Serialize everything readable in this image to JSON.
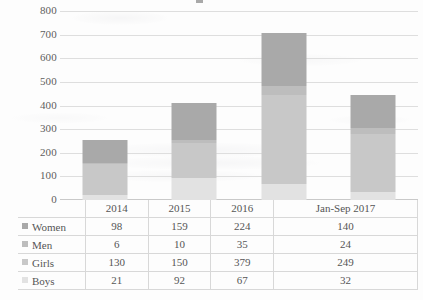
{
  "chart_data": {
    "type": "bar",
    "subtype": "stacked-column",
    "title": "",
    "xlabel": "",
    "ylabel": "",
    "ylim": [
      0,
      800
    ],
    "ytick_step": 100,
    "yticks": [
      "800",
      "700",
      "600",
      "500",
      "400",
      "300",
      "200",
      "100",
      "0"
    ],
    "grid": true,
    "legend_position": "table-left",
    "categories": [
      "2014",
      "2015",
      "2016",
      "Jan-Sep 2017"
    ],
    "stack_order_bottom_to_top": [
      "Boys",
      "Girls",
      "Men",
      "Women"
    ],
    "series": [
      {
        "name": "Women",
        "values": [
          98,
          159,
          224,
          140
        ],
        "color": "#a9a9a9"
      },
      {
        "name": "Men",
        "values": [
          6,
          10,
          35,
          24
        ],
        "color": "#bdbdbd"
      },
      {
        "name": "Girls",
        "values": [
          130,
          150,
          379,
          249
        ],
        "color": "#c8c8c8"
      },
      {
        "name": "Boys",
        "values": [
          21,
          92,
          67,
          32
        ],
        "color": "#e2e2e2"
      }
    ],
    "totals": [
      255,
      411,
      705,
      445
    ]
  },
  "table": {
    "header": [
      "",
      "2014",
      "2015",
      "Jan-Sep 2017"
    ],
    "column_headers": [
      "2014",
      "2015",
      "2016",
      "Jan-Sep 2017"
    ],
    "rows": [
      {
        "label": "Women",
        "swatch": "legend-swatch-women",
        "values": [
          "98",
          "159",
          "224",
          "140"
        ]
      },
      {
        "label": "Men",
        "swatch": "legend-swatch-men",
        "values": [
          "6",
          "10",
          "35",
          "24"
        ]
      },
      {
        "label": "Girls",
        "swatch": "legend-swatch-girls",
        "values": [
          "130",
          "150",
          "379",
          "249"
        ]
      },
      {
        "label": "Boys",
        "swatch": "legend-swatch-boys",
        "values": [
          "21",
          "92",
          "67",
          "32"
        ]
      }
    ]
  }
}
